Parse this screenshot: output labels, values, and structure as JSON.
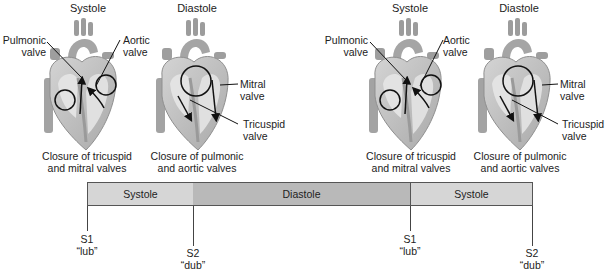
{
  "panels": [
    {
      "title": "Systole",
      "labels": {
        "left": "Pulmonic\nvalve",
        "right": "Aortic\nvalve"
      },
      "left_label_lines": [
        "Pulmonic",
        "valve"
      ],
      "right_label_lines": [
        "Aortic",
        "valve"
      ],
      "caption_lines": [
        "Closure of tricuspid",
        "and mitral valves"
      ]
    },
    {
      "title": "Diastole",
      "right_label_1_lines": [
        "Mitral",
        "valve"
      ],
      "right_label_2_lines": [
        "Tricuspid",
        "valve"
      ],
      "caption_lines": [
        "Closure of pulmonic",
        "and aortic valves"
      ]
    },
    {
      "title": "Systole",
      "left_label_lines": [
        "Pulmonic",
        "valve"
      ],
      "right_label_lines": [
        "Aortic",
        "valve"
      ],
      "caption_lines": [
        "Closure of tricuspid",
        "and mitral valves"
      ]
    },
    {
      "title": "Diastole",
      "right_label_1_lines": [
        "Mitral",
        "valve"
      ],
      "right_label_2_lines": [
        "Tricuspid",
        "valve"
      ],
      "caption_lines": [
        "Closure of pulmonic",
        "and aortic valves"
      ]
    }
  ],
  "timeline": {
    "segments": [
      {
        "label": "Systole",
        "color": "#d6d6d6"
      },
      {
        "label": "Diastole",
        "color": "#b9b9b9"
      },
      {
        "label": "Systole",
        "color": "#d6d6d6"
      }
    ],
    "markers": [
      {
        "sound": "S1",
        "word": "“lub”"
      },
      {
        "sound": "S2",
        "word": "“dub”"
      },
      {
        "sound": "S1",
        "word": "“lub”"
      },
      {
        "sound": "S2",
        "word": "“dub”"
      }
    ]
  }
}
